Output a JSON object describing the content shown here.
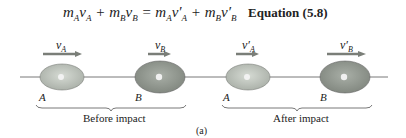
{
  "equation": {
    "lhs": "m_A v_A + m_B v_B",
    "rhs": "m_A v'_A + m_B v'_B",
    "label": "Equation (5.8)"
  },
  "before": {
    "caption": "Before impact",
    "ball_a": {
      "label": "A",
      "velocity": "v_A"
    },
    "ball_b": {
      "label": "B",
      "velocity": "v_B"
    }
  },
  "after": {
    "caption": "After impact",
    "ball_a": {
      "label": "A",
      "velocity": "v'_A"
    },
    "ball_b": {
      "label": "B",
      "velocity": "v'_B"
    }
  },
  "figure_label": "(a)",
  "colors": {
    "ball_a_fill": "#b9c0b8",
    "ball_b_fill": "#8f958d",
    "arrow": "#7a7e78",
    "line": "#555555"
  }
}
